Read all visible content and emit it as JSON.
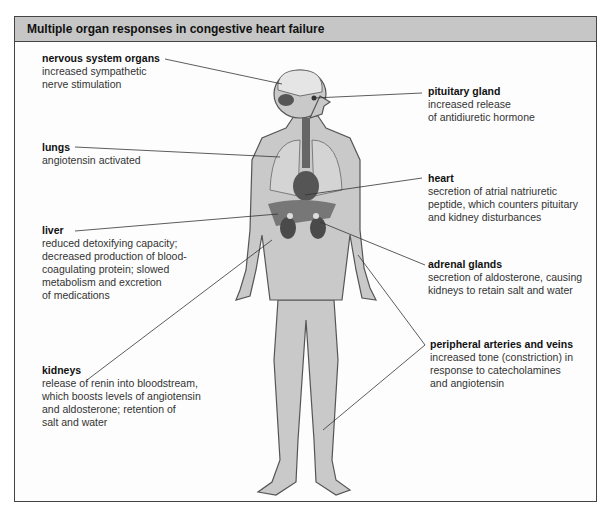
{
  "title": "Multiple organ responses in congestive heart failure",
  "labels": {
    "nervous": {
      "title": "nervous system organs",
      "desc": "increased sympathetic\nnerve stimulation"
    },
    "lungs": {
      "title": "lungs",
      "desc": "angiotensin activated"
    },
    "liver": {
      "title": "liver",
      "desc": "reduced detoxifying capacity;\ndecreased production of blood-\ncoagulating protein; slowed\nmetabolism and excretion\nof medications"
    },
    "kidneys": {
      "title": "kidneys",
      "desc": "release of renin into bloodstream,\nwhich boosts levels of angiotensin\nand aldosterone; retention of\nsalt and water"
    },
    "pituitary": {
      "title": "pituitary gland",
      "desc": "increased release\nof antidiuretic hormone"
    },
    "heart": {
      "title": "heart",
      "desc": "secretion of atrial natriuretic\npeptide, which counters pituitary\nand kidney disturbances"
    },
    "adrenal": {
      "title": "adrenal glands",
      "desc": "secretion of aldosterone, causing\nkidneys to retain salt and water"
    },
    "peripheral": {
      "title": "peripheral arteries and veins",
      "desc": "increased tone (constriction) in\nresponse to catecholamines\nand angiotensin"
    }
  },
  "colors": {
    "header": "#c6c6c6",
    "body": "#c9c9c9",
    "outline": "#555555",
    "organ": "#6a6a6a"
  }
}
